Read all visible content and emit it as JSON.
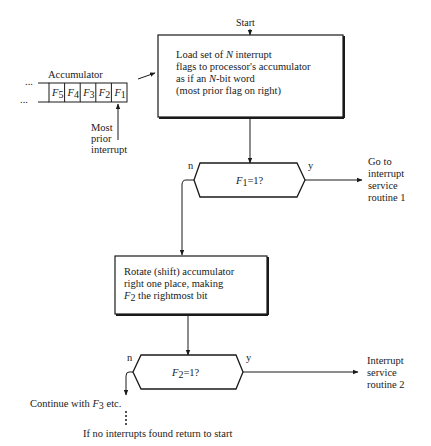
{
  "diagram": {
    "start_label": "Start",
    "load_box": {
      "lines": [
        "Load set of N interrupt",
        "flags to processor's accumulator",
        "as if an N-bit word",
        "(most prior flag on right)"
      ]
    },
    "accumulator": {
      "label": "Accumulator",
      "cells": [
        "F5",
        "F4",
        "F3",
        "F2",
        "F1"
      ],
      "cell_display": [
        {
          "main": "F",
          "sub": "5"
        },
        {
          "main": "F",
          "sub": "4"
        },
        {
          "main": "F",
          "sub": "3"
        },
        {
          "main": "F",
          "sub": "2"
        },
        {
          "main": "F",
          "sub": "1"
        }
      ],
      "ellipsis": "...",
      "pointer_label": [
        "Most",
        "prior",
        "interrupt"
      ]
    },
    "decision1": {
      "condition": "F1=1?",
      "cond_main": "F",
      "cond_sub": "1",
      "cond_rest": "=1?",
      "no_label": "n",
      "yes_label": "y",
      "yes_target": [
        "Go to",
        "interrupt",
        "service",
        "routine 1"
      ]
    },
    "rotate_box": {
      "lines": [
        "Rotate (shift) accumulator",
        "right one place, making",
        "F2 the rightmost bit"
      ],
      "line3_main": "F",
      "line3_sub": "2",
      "line3_rest": " the rightmost bit"
    },
    "decision2": {
      "condition": "F2=1?",
      "cond_main": "F",
      "cond_sub": "2",
      "cond_rest": "=1?",
      "no_label": "n",
      "yes_label": "y",
      "yes_target": [
        "Interrupt",
        "service",
        "routine 2"
      ]
    },
    "continue_label": "Continue with F3 etc.",
    "continue_pre": "Continue with ",
    "continue_main": "F",
    "continue_sub": "3",
    "continue_post": " etc.",
    "return_label": "If no interrupts found return to start"
  }
}
